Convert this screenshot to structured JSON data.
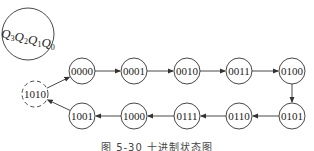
{
  "legend": {
    "label_parts": [
      {
        "base": "Q",
        "sub": "3"
      },
      {
        "base": "Q",
        "sub": "2"
      },
      {
        "base": "Q",
        "sub": "1"
      },
      {
        "base": "Q",
        "sub": "0"
      }
    ]
  },
  "states": [
    {
      "id": "s0",
      "label": "0000",
      "cx": 82,
      "cy": 71,
      "dashed": false
    },
    {
      "id": "s1",
      "label": "0001",
      "cx": 134,
      "cy": 71,
      "dashed": false
    },
    {
      "id": "s2",
      "label": "0010",
      "cx": 187,
      "cy": 71,
      "dashed": false
    },
    {
      "id": "s3",
      "label": "0011",
      "cx": 239,
      "cy": 71,
      "dashed": false
    },
    {
      "id": "s4",
      "label": "0100",
      "cx": 292,
      "cy": 71,
      "dashed": false
    },
    {
      "id": "s5",
      "label": "0101",
      "cx": 292,
      "cy": 116,
      "dashed": false
    },
    {
      "id": "s6",
      "label": "0110",
      "cx": 239,
      "cy": 116,
      "dashed": false
    },
    {
      "id": "s7",
      "label": "0111",
      "cx": 187,
      "cy": 116,
      "dashed": false
    },
    {
      "id": "s8",
      "label": "1000",
      "cx": 134,
      "cy": 116,
      "dashed": false
    },
    {
      "id": "s9",
      "label": "1001",
      "cx": 82,
      "cy": 116,
      "dashed": false
    },
    {
      "id": "s10",
      "label": "1010",
      "cx": 35,
      "cy": 94,
      "dashed": true
    }
  ],
  "transitions": [
    [
      "s0",
      "s1"
    ],
    [
      "s1",
      "s2"
    ],
    [
      "s2",
      "s3"
    ],
    [
      "s3",
      "s4"
    ],
    [
      "s4",
      "s5"
    ],
    [
      "s5",
      "s6"
    ],
    [
      "s6",
      "s7"
    ],
    [
      "s7",
      "s8"
    ],
    [
      "s8",
      "s9"
    ],
    [
      "s9",
      "s10"
    ],
    [
      "s10",
      "s0"
    ]
  ],
  "caption": "图 5-30  十进制状态图",
  "colors": {
    "stroke": "#333333",
    "text": "#222222"
  }
}
